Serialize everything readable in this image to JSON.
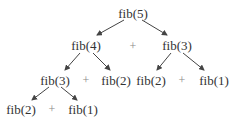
{
  "diagram": {
    "title": "",
    "nodes": [
      {
        "id": "n0",
        "label": "fib(5)",
        "x": 133,
        "y": 13
      },
      {
        "id": "n1",
        "label": "fib(4)",
        "x": 86,
        "y": 45
      },
      {
        "id": "n2",
        "label": "fib(3)",
        "x": 177,
        "y": 45
      },
      {
        "id": "n3",
        "label": "fib(3)",
        "x": 55,
        "y": 80
      },
      {
        "id": "n4",
        "label": "fib(2)",
        "x": 116,
        "y": 80
      },
      {
        "id": "n5",
        "label": "fib(2)",
        "x": 151,
        "y": 80
      },
      {
        "id": "n6",
        "label": "fib(1)",
        "x": 214,
        "y": 80
      },
      {
        "id": "n7",
        "label": "fib(2)",
        "x": 21,
        "y": 109
      },
      {
        "id": "n8",
        "label": "fib(1)",
        "x": 83,
        "y": 109
      }
    ],
    "operators": [
      {
        "label": "+",
        "x": 133,
        "y": 46
      },
      {
        "label": "+",
        "x": 86,
        "y": 80
      },
      {
        "label": "+",
        "x": 182,
        "y": 80
      },
      {
        "label": "+",
        "x": 52,
        "y": 109
      }
    ],
    "edges": [
      {
        "from": "n0",
        "to": "n1",
        "x1": 124,
        "y1": 20,
        "x2": 97,
        "y2": 35
      },
      {
        "from": "n0",
        "to": "n2",
        "x1": 142,
        "y1": 20,
        "x2": 167,
        "y2": 35
      },
      {
        "from": "n1",
        "to": "n3",
        "x1": 80,
        "y1": 53,
        "x2": 65,
        "y2": 70
      },
      {
        "from": "n1",
        "to": "n4",
        "x1": 93,
        "y1": 53,
        "x2": 110,
        "y2": 70
      },
      {
        "from": "n2",
        "to": "n5",
        "x1": 171,
        "y1": 53,
        "x2": 157,
        "y2": 70
      },
      {
        "from": "n2",
        "to": "n6",
        "x1": 183,
        "y1": 53,
        "x2": 204,
        "y2": 70
      },
      {
        "from": "n3",
        "to": "n7",
        "x1": 49,
        "y1": 87,
        "x2": 32,
        "y2": 100
      },
      {
        "from": "n3",
        "to": "n8",
        "x1": 61,
        "y1": 87,
        "x2": 77,
        "y2": 100
      }
    ],
    "colors": {
      "text": "#333333",
      "edge": "#444444",
      "operator": "#888888",
      "background": "#ffffff"
    }
  }
}
